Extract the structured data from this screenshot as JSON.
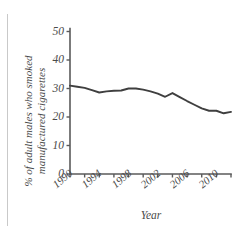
{
  "chart_data": {
    "type": "line",
    "title": "",
    "xlabel": "Year",
    "ylabel": "% of adult males who smoked manufactured cigarettes",
    "xlim": [
      1990,
      2012
    ],
    "ylim": [
      0,
      50
    ],
    "grid": false,
    "legend": null,
    "y_ticks": [
      0,
      10,
      20,
      30,
      40,
      50
    ],
    "y_tick_labels": [
      "0",
      "10",
      "20",
      "30",
      "40",
      "50"
    ],
    "x_ticks": [
      1990,
      1992,
      1994,
      1996,
      1998,
      2000,
      2002,
      2004,
      2006,
      2008,
      2010,
      2012
    ],
    "x_tick_labels": [
      "1990",
      "",
      "1994",
      "",
      "1998",
      "",
      "2002",
      "",
      "2006",
      "",
      "2010",
      ""
    ],
    "x_major_labels": [
      "1990",
      "1994",
      "1998",
      "2002",
      "2006",
      "2010"
    ],
    "series": [
      {
        "name": "% of adult males who smoked manufactured cigarettes",
        "color": "#3f3f3f",
        "x": [
          1990,
          1991,
          1992,
          1993,
          1994,
          1995,
          1996,
          1997,
          1998,
          1999,
          2000,
          2001,
          2002,
          2003,
          2004,
          2005,
          2006,
          2007,
          2008,
          2009,
          2010,
          2011,
          2012
        ],
        "values": [
          31.0,
          30.6,
          30.2,
          29.4,
          28.6,
          29.0,
          29.2,
          29.3,
          30.0,
          30.0,
          29.6,
          29.0,
          28.2,
          27.1,
          28.4,
          27.0,
          25.6,
          24.3,
          23.0,
          22.2,
          22.2,
          21.3,
          21.8
        ]
      }
    ]
  },
  "axis": {
    "y_label_text": "% of adult males who smoked manufactured cigarettes",
    "x_label_text": "Year"
  },
  "colors": {
    "line": "#3f3f3f",
    "axis": "#5a5a5a",
    "text": "#4a4a4a",
    "rule": "#c9c9c9",
    "background": "#ffffff"
  }
}
